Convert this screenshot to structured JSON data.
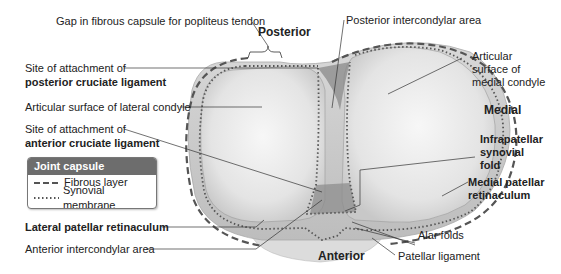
{
  "figure": {
    "orientation": {
      "posterior": "Posterior",
      "anterior": "Anterior",
      "medial": "Medial"
    },
    "labels_left": {
      "gap_popliteus": "Gap in fibrous capsule for popliteus tendon",
      "pcl_line1": "Site of attachment of",
      "pcl_line2": "posterior cruciate ligament",
      "lateral_condyle": "Articular surface of lateral condyle",
      "acl_line1": "Site of attachment of",
      "acl_line2": "anterior cruciate ligament",
      "lateral_retinaculum": "Lateral patellar retinaculum",
      "anterior_intercondylar": "Anterior intercondylar area"
    },
    "labels_right": {
      "posterior_intercondylar": "Posterior intercondylar area",
      "medial_condyle_line1": "Articular",
      "medial_condyle_line2": "surface of",
      "medial_condyle_line3": "medial condyle",
      "infrapatellar_line1": "Infrapatellar",
      "infrapatellar_line2": "synovial",
      "infrapatellar_line3": "fold",
      "medial_retinaculum_line1": "Medial patellar",
      "medial_retinaculum_line2": "retinaculum",
      "alar_folds": "Alar folds",
      "patellar_ligament": "Patellar ligament"
    },
    "legend": {
      "title": "Joint capsule",
      "items": [
        {
          "style": "dashed",
          "label": "Fibrous layer"
        },
        {
          "style": "dotted",
          "label": "Synovial membrane"
        }
      ]
    },
    "colors": {
      "legend_header": "#6d6d6d",
      "fibrous_line": "#555555",
      "synovial_dots": "#555555",
      "bone_fill": "#e6e6e6",
      "intercondylar_shadow": "#8a8a8a"
    }
  }
}
